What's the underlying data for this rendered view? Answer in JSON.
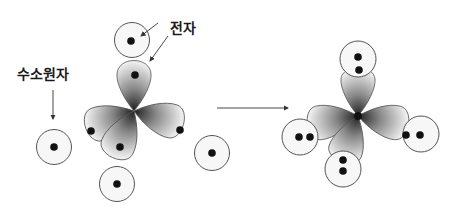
{
  "labels": {
    "electron": "전자",
    "hydrogen_atom": "수소원자"
  },
  "colors": {
    "stroke": "#5a5a5a",
    "dot": "#111111",
    "lobe_dark": "#2a2a2a",
    "lobe_light": "#f2f2f2",
    "background": "#ffffff"
  },
  "before": {
    "central_lobes": 4,
    "electrons_per_lobe": 1,
    "hydrogen_atoms": 4,
    "electrons_per_hydrogen": 1
  },
  "after": {
    "bonded_hydrogens": 4,
    "electrons_per_bond": 2
  }
}
